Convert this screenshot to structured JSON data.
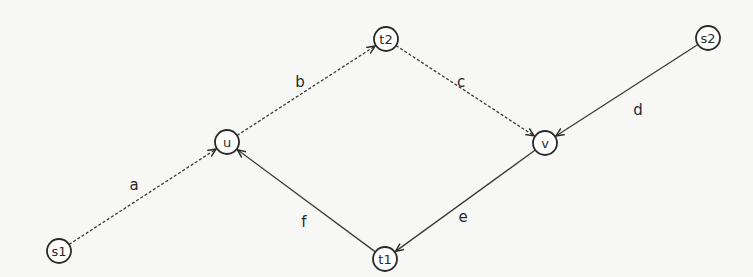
{
  "diagram": {
    "type": "directed-graph",
    "nodes": [
      {
        "id": "s1",
        "label": "s1",
        "x": 59,
        "y": 251
      },
      {
        "id": "u",
        "label": "u",
        "x": 227,
        "y": 142
      },
      {
        "id": "t2",
        "label": "t2",
        "x": 386,
        "y": 39
      },
      {
        "id": "v",
        "label": "v",
        "x": 545,
        "y": 143
      },
      {
        "id": "s2",
        "label": "s2",
        "x": 708,
        "y": 38
      },
      {
        "id": "t1",
        "label": "t1",
        "x": 385,
        "y": 259
      }
    ],
    "edges": [
      {
        "id": "a",
        "label": "a",
        "from": "s1",
        "to": "u",
        "style": "dashed",
        "label_x": 134,
        "label_y": 185
      },
      {
        "id": "b",
        "label": "b",
        "from": "u",
        "to": "t2",
        "style": "dashed",
        "label_x": 300,
        "label_y": 82
      },
      {
        "id": "c",
        "label": "c",
        "from": "t2",
        "to": "v",
        "style": "dashed",
        "label_x": 461,
        "label_y": 82
      },
      {
        "id": "d",
        "label": "d",
        "from": "s2",
        "to": "v",
        "style": "solid",
        "label_x": 638,
        "label_y": 110
      },
      {
        "id": "e",
        "label": "e",
        "from": "v",
        "to": "t1",
        "style": "solid",
        "label_x": 463,
        "label_y": 217
      },
      {
        "id": "f",
        "label": "f",
        "from": "t1",
        "to": "u",
        "style": "solid",
        "label_x": 304,
        "label_y": 222
      }
    ],
    "node_radius": 12,
    "colors": {
      "background": "#f7f7f6",
      "stroke": "#2a2a2a",
      "node_fill": "#ffffff"
    }
  }
}
